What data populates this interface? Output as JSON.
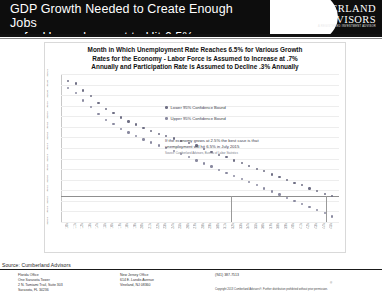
{
  "header": {
    "title_line1": "GDP Growth Needed to Create Enough Jobs",
    "title_line2": "for Unemployment to Hit 6.5%",
    "logo_line1": "CUMBERLAND",
    "logo_line2": "ADVISORS",
    "logo_sub": "A REGISTERED INVESTMENT ADVISOR",
    "logo_registered": "®"
  },
  "chart_data": {
    "type": "scatter",
    "title_line1": "Month in Which Unemployment Rate Reaches 6.5% for Various Growth",
    "title_line2": "Rates for the Economy - Labor Force is Assumed to Increase at .7%",
    "title_line3": "Annually and Participation Rate is Assumed to Decline .3% Annually",
    "xlabel": "",
    "ylabel": "",
    "grid": true,
    "legend_position": "inside-upper-center",
    "legend": [
      "Lower 95% Confidence Bound",
      "Upper 95% Confidence Bound"
    ],
    "annotation_line1": "If the economy grows at 2.5% the best case is that",
    "annotation_line2": "unemployment will hit 6.5% in July 2015",
    "annotation_source": "Source: Cumberland Advisors, Bureau of Labor Statistics",
    "categories": [
      "1.0%",
      "1.1%",
      "1.2%",
      "1.3%",
      "1.4%",
      "1.5%",
      "1.6%",
      "1.7%",
      "1.8%",
      "1.9%",
      "2.0%",
      "2.1%",
      "2.2%",
      "2.3%",
      "2.4%",
      "2.5%",
      "2.6%",
      "2.7%",
      "2.8%",
      "2.9%",
      "3.0%",
      "3.1%",
      "3.2%",
      "3.3%",
      "3.4%",
      "3.5%",
      "3.6%",
      "3.7%",
      "3.8%",
      "3.9%",
      "4.0%",
      "4.1%",
      "4.2%",
      "4.3%",
      "4.4%",
      "4.5%"
    ],
    "ytick_labels": [
      "Jan-21",
      "Jul-20",
      "Jan-20",
      "Jul-19",
      "Jan-19",
      "Jul-18",
      "Jan-18",
      "Jul-17",
      "Jan-17",
      "Jul-16",
      "Jan-16",
      "Jul-15",
      "Jan-15",
      "Jul-14",
      "Jan-14"
    ],
    "series": [
      {
        "name": "Lower 95% Confidence Bound",
        "values": [
          5,
          8,
          17,
          24,
          33,
          41,
          46,
          52,
          57,
          61,
          65,
          69,
          73,
          76,
          79,
          82,
          85,
          88,
          92,
          96,
          100,
          103,
          107,
          110,
          114,
          118,
          121,
          125,
          128,
          132,
          136,
          139,
          143,
          146,
          150,
          153
        ]
      },
      {
        "name": "Upper 95% Confidence Bound",
        "values": [
          14,
          20,
          30,
          38,
          47,
          55,
          60,
          67,
          71,
          76,
          80,
          84,
          88,
          91,
          95,
          99,
          103,
          107,
          111,
          115,
          119,
          123,
          127,
          131,
          135,
          139,
          143,
          147,
          151,
          155,
          159,
          163,
          167,
          171,
          175,
          179
        ]
      }
    ],
    "marker_vline_category": "2.5%"
  },
  "footer": {
    "source": "Source: Cumberland Advisors",
    "office1_l1": "Florida Office",
    "office1_l2": "One Sarasota Tower",
    "office1_l3": "2 N. Tamiami Trail, Suite 303",
    "office1_l4": "Sarasota, FL 34236",
    "office2_l1": "New Jersey Office",
    "office2_l2": "614 E. Landis Avenue",
    "office2_l3": "Vineland, NJ 08360",
    "phone": "(941) 387-7513",
    "disclaimer": "Copyright 2013 Cumberland Advisors®. Further distribution prohibited without prior permission."
  }
}
